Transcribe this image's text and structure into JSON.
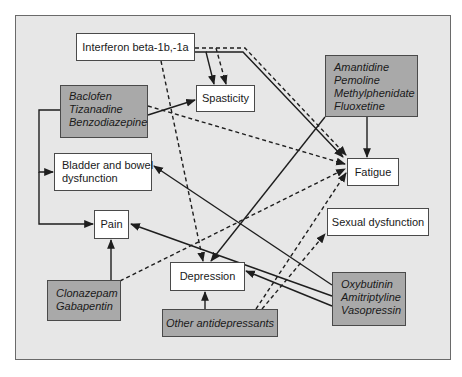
{
  "diagram": {
    "nodes": {
      "interferon": {
        "lines": [
          "Interferon beta-1b,-1a"
        ],
        "type": "treatment-plain"
      },
      "baclofen": {
        "lines": [
          "Baclofen",
          "Tizanadine",
          "Benzodiazepine"
        ],
        "type": "drug-group"
      },
      "spasticity": {
        "lines": [
          "Spasticity"
        ],
        "type": "symptom"
      },
      "amantidine": {
        "lines": [
          "Amantidine",
          "Pemoline",
          "Methylphenidate",
          "Fluoxetine"
        ],
        "type": "drug-group"
      },
      "bladder": {
        "lines": [
          "Bladder and bowel",
          "dysfunction"
        ],
        "type": "symptom"
      },
      "fatigue": {
        "lines": [
          "Fatigue"
        ],
        "type": "symptom"
      },
      "pain": {
        "lines": [
          "Pain"
        ],
        "type": "symptom"
      },
      "sexual": {
        "lines": [
          "Sexual dysfunction"
        ],
        "type": "symptom"
      },
      "depression": {
        "lines": [
          "Depression"
        ],
        "type": "symptom"
      },
      "clonazepam": {
        "lines": [
          "Clonazepam",
          "Gabapentin"
        ],
        "type": "drug-group"
      },
      "antidepressants": {
        "lines": [
          "Other antidepressants"
        ],
        "type": "drug-group"
      },
      "oxybutinin": {
        "lines": [
          "Oxybutinin",
          "Amitriptyline",
          "Vasopressin"
        ],
        "type": "drug-group"
      }
    },
    "edges": [
      {
        "from": "interferon",
        "to": "spasticity",
        "style": "solid"
      },
      {
        "from": "interferon",
        "to": "spasticity",
        "style": "dashed"
      },
      {
        "from": "interferon",
        "to": "fatigue",
        "style": "solid"
      },
      {
        "from": "interferon",
        "to": "fatigue",
        "style": "dashed"
      },
      {
        "from": "interferon",
        "to": "depression",
        "style": "dashed"
      },
      {
        "from": "baclofen",
        "to": "spasticity",
        "style": "solid"
      },
      {
        "from": "baclofen",
        "to": "fatigue",
        "style": "dashed"
      },
      {
        "from": "baclofen",
        "to": "bladder",
        "style": "solid"
      },
      {
        "from": "baclofen",
        "to": "pain",
        "style": "solid"
      },
      {
        "from": "amantidine",
        "to": "fatigue",
        "style": "solid"
      },
      {
        "from": "amantidine",
        "to": "depression",
        "style": "solid"
      },
      {
        "from": "clonazepam",
        "to": "pain",
        "style": "solid"
      },
      {
        "from": "clonazepam",
        "to": "fatigue",
        "style": "dashed"
      },
      {
        "from": "antidepressants",
        "to": "depression",
        "style": "solid"
      },
      {
        "from": "antidepressants",
        "to": "fatigue",
        "style": "dashed"
      },
      {
        "from": "antidepressants",
        "to": "sexual",
        "style": "dashed"
      },
      {
        "from": "oxybutinin",
        "to": "bladder",
        "style": "solid"
      },
      {
        "from": "oxybutinin",
        "to": "pain",
        "style": "solid"
      },
      {
        "from": "oxybutinin",
        "to": "depression",
        "style": "solid"
      }
    ],
    "colors": {
      "background": "#e7e7e7",
      "drug_box": "#a9a9a9",
      "symptom_box": "#ffffff",
      "line": "#1e1e1e"
    }
  }
}
